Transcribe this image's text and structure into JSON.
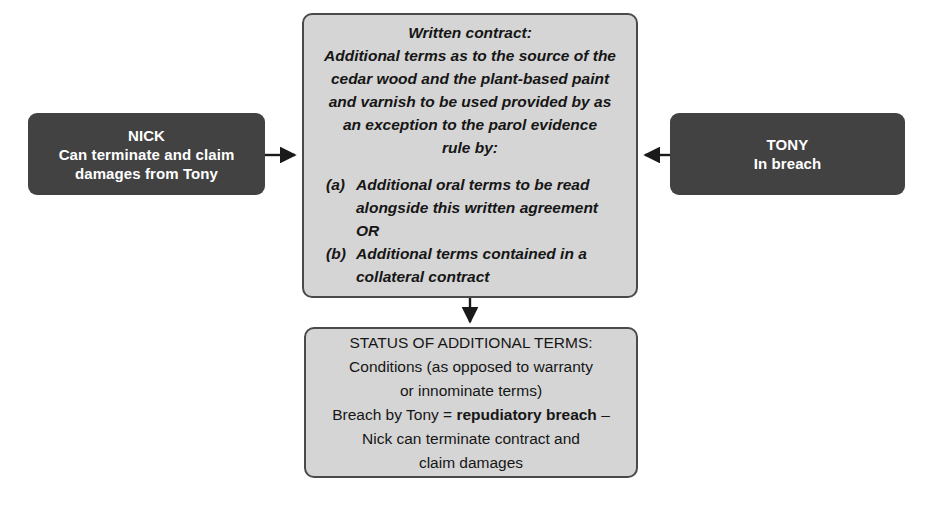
{
  "diagram": {
    "title_hidden": "",
    "colors": {
      "dark_box_fill": "#424242",
      "dark_box_text": "#ffffff",
      "light_box_fill": "#d5d5d5",
      "light_box_border": "#4a4a4a",
      "light_box_text": "#161616",
      "arrow": "#1a1a1a",
      "page_background": "#ffffff"
    },
    "nick_box": {
      "heading": "NICK",
      "line1": "Can terminate and claim",
      "line2": "damages from Tony"
    },
    "tony_box": {
      "heading": "TONY",
      "line1": "In breach"
    },
    "center_box": {
      "lines": [
        "Written contract:",
        "Additional terms as to the source of the",
        "cedar wood and the plant-based paint",
        "and varnish to be used provided by as",
        "an exception to the parol evidence",
        "rule by:"
      ],
      "items": [
        {
          "label": "(a)",
          "line1": "Additional oral terms to be read",
          "line2": "alongside this written agreement",
          "line3": "OR"
        },
        {
          "label": "(b)",
          "line1": "Additional terms contained in a",
          "line2": "collateral contract"
        }
      ]
    },
    "status_box": {
      "line1": "STATUS OF ADDITIONAL TERMS:",
      "line2": "Conditions (as opposed to warranty",
      "line3": "or innominate terms)",
      "line4_prefix": "Breach by Tony = ",
      "line4_bold": "repudiatory breach",
      "line4_suffix": " –",
      "line5": "Nick can terminate contract and",
      "line6": "claim damages"
    },
    "arrows": {
      "nick_to_center": "arrow-right",
      "tony_to_center": "arrow-left",
      "center_to_status": "arrow-down"
    }
  }
}
